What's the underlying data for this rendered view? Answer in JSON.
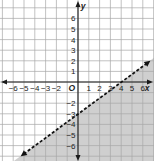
{
  "chart_data": {
    "type": "line",
    "title": "",
    "xlabel": "x",
    "ylabel": "y",
    "origin_label": "O",
    "xlim": [
      -7,
      7
    ],
    "ylim": [
      -7,
      7
    ],
    "x_ticks": [
      -6,
      -5,
      -4,
      -3,
      -2,
      1,
      2,
      3,
      4,
      5,
      6
    ],
    "x_tick_labels": [
      "−6",
      "−5",
      "−4",
      "−3",
      "−2",
      "1",
      "2",
      "3",
      "4",
      "5",
      "6"
    ],
    "y_ticks": [
      6,
      5,
      4,
      3,
      2,
      1,
      -2,
      -3,
      -4,
      -5,
      -6
    ],
    "y_tick_labels": [
      "6",
      "5",
      "4",
      "3",
      "2",
      "1",
      "−2",
      "−3",
      "−4",
      "−5",
      "−6"
    ],
    "grid": true,
    "boundary_line": {
      "equation": "y = 3/4 x - 3",
      "slope": 0.75,
      "y_intercept": -3,
      "x_intercept": 4,
      "style": "dashed",
      "points": [
        [
          -5.3,
          -7
        ],
        [
          0,
          -3
        ],
        [
          4,
          0
        ],
        [
          6.7,
          2
        ]
      ]
    },
    "inequality": "y < 3/4 x - 3",
    "shaded_region": "below-right of line",
    "colors": {
      "shade": "#cfcfcf",
      "grid": "#a8a8a8",
      "axis": "#1a1a1a",
      "line": "#111111",
      "background": "#ffffff"
    }
  }
}
